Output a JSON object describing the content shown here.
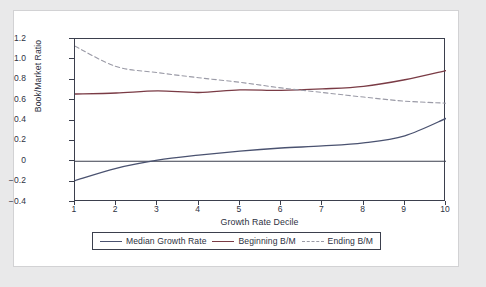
{
  "figure": {
    "background_color": "#e9e9ea",
    "card_color": "#ffffff",
    "axis_color": "#3b3f4d"
  },
  "chart_data": {
    "type": "line",
    "title": "",
    "xlabel": "Growth Rate Decile",
    "ylabel": "Book/Market Ratio",
    "x": [
      1,
      2,
      3,
      4,
      5,
      6,
      7,
      8,
      9,
      10
    ],
    "xlim": [
      1,
      10
    ],
    "ylim": [
      -0.4,
      1.2
    ],
    "ytick_labels": [
      "1.2",
      "1.0",
      "0.8",
      "0.6",
      "0.4",
      "0.2",
      "0",
      "-0.2",
      "-0.4"
    ],
    "ytick_values": [
      1.2,
      1.0,
      0.8,
      0.6,
      0.4,
      0.2,
      0,
      -0.2,
      -0.4
    ],
    "xtick_labels": [
      "1",
      "2",
      "3",
      "4",
      "5",
      "6",
      "7",
      "8",
      "9",
      "10"
    ],
    "grid": false,
    "zero_line": true,
    "legend_position": "below-axis",
    "series": [
      {
        "name": "Median Growth Rate",
        "color": "#4a5270",
        "style": "solid",
        "values": [
          -0.19,
          -0.07,
          0.01,
          0.06,
          0.1,
          0.13,
          0.15,
          0.18,
          0.25,
          0.42
        ]
      },
      {
        "name": "Beginning B/M",
        "color": "#7a3b45",
        "style": "solid",
        "values": [
          0.66,
          0.67,
          0.69,
          0.675,
          0.7,
          0.695,
          0.71,
          0.735,
          0.8,
          0.89
        ]
      },
      {
        "name": "Ending B/M",
        "color": "#9a9aa6",
        "style": "dashed",
        "values": [
          1.13,
          0.93,
          0.87,
          0.82,
          0.775,
          0.72,
          0.675,
          0.63,
          0.59,
          0.57
        ]
      }
    ]
  }
}
